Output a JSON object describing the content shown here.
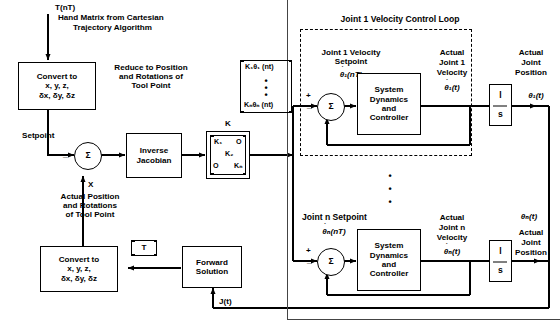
{
  "figure": {
    "title_top_signal": "T(nT)",
    "title_top_desc_1": "Hand Matrix from Cartesian",
    "title_top_desc_2": "Trajectory Algorithm"
  },
  "blocks": {
    "convert_top": "Convert to\nx, y, z,\nδx, δy, δz",
    "convert_bottom": "Convert to\nx, y, z,\nδx, δy, δz",
    "inverse_jacobian": "Inverse\nJacobian",
    "forward_solution": "Forward\nSolution",
    "sys_dyn_1": "System\nDynamics\nand\nController",
    "sys_dyn_n": "System\nDynamics\nand\nController",
    "integrator_1_num": "l",
    "integrator_1_den": "s",
    "integrator_n_num": "l",
    "integrator_n_den": "s",
    "sum_symbol": "Σ"
  },
  "labels": {
    "reduce_note": "Reduce to Position\nand Rotations of\nTool Point",
    "setpoint": "Setpoint",
    "x_signal": "X",
    "actual_pos_note": "Actual Position\nand Rotations\nof Tool Point",
    "k_gain": "K",
    "t_matrix": "T",
    "j_of_t": "J(t)",
    "loop1_title": "Joint 1 Velocity Control Loop",
    "joint1_setpoint_1": "Joint 1 Velocity",
    "joint1_setpoint_2": "Setpoint",
    "joint1_setpoint_sym": "θ₁(nT)",
    "joint1_actual_vel_1": "Actual",
    "joint1_actual_vel_2": "Joint 1",
    "joint1_actual_vel_3": "Velocity",
    "joint1_actual_vel_sym": "θ₁(t)",
    "joint1_actual_pos_1": "Actual",
    "joint1_actual_pos_2": "Joint",
    "joint1_actual_pos_3": "Position",
    "joint1_actual_pos_sym": "θ₁(t)",
    "jointn_setpoint": "Joint n Setpoint",
    "jointn_setpoint_sym": "θₙ(nT)",
    "jointn_actual_vel_1": "Actual",
    "jointn_actual_vel_2": "Joint n",
    "jointn_actual_vel_3": "Velocity",
    "jointn_actual_vel_sym": "θₙ(t)",
    "jointn_actual_pos_1": "Actual",
    "jointn_actual_pos_2": "Joint",
    "jointn_actual_pos_3": "Position",
    "jointn_actual_pos_sym": "θₙ(t)",
    "plus": "+",
    "minus": "−",
    "minus_js": "_"
  },
  "k_matrix": {
    "r1c1": "K₁",
    "r1c2": "O",
    "r2_mid": "K₂",
    "r3c1": "O",
    "r3c2": "Kₙ"
  },
  "velocity_vector": {
    "top": "K₁θ₁ (nt)",
    "bottom": "Kₙθₙ (nt)",
    "dots": "•\n•\n•"
  },
  "colors": {
    "line": "#000000",
    "frame": "#444444",
    "background": "#ffffff"
  }
}
